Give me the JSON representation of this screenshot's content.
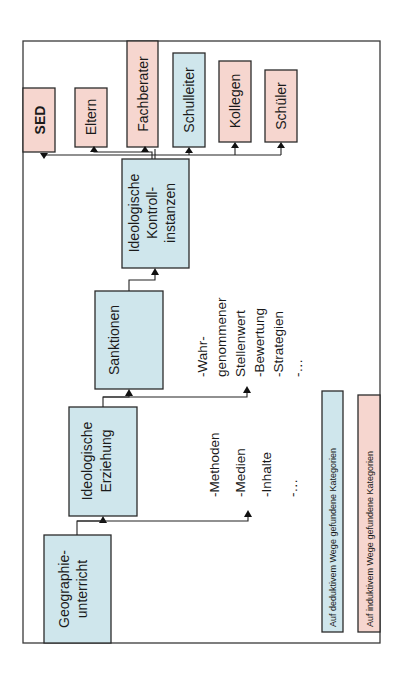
{
  "diagram": {
    "orientation": "rotated-90-ccw",
    "colors": {
      "deductive": "#cfe6ec",
      "inductive": "#f6d6cf",
      "border": "#2b2b2b"
    },
    "flow": [
      {
        "id": "geographie",
        "lines": [
          "Geographie-",
          "unterricht"
        ],
        "category": "deductive"
      },
      {
        "id": "erziehung",
        "lines": [
          "Ideologische",
          "Erziehung"
        ],
        "category": "deductive"
      },
      {
        "id": "sanktionen",
        "lines": [
          "Sanktionen"
        ],
        "category": "deductive"
      },
      {
        "id": "kontroll",
        "lines": [
          "Ideologische",
          "Kontroll-",
          "instanzen"
        ],
        "category": "deductive"
      }
    ],
    "instances": [
      {
        "id": "sed",
        "label": "SED",
        "category": "inductive"
      },
      {
        "id": "eltern",
        "label": "Eltern",
        "category": "inductive"
      },
      {
        "id": "fachberater",
        "label": "Fachberater",
        "category": "inductive"
      },
      {
        "id": "schulleiter",
        "label": "Schulleiter",
        "category": "deductive"
      },
      {
        "id": "kollegen",
        "label": "Kollegen",
        "category": "inductive"
      },
      {
        "id": "schueler",
        "label": "Schüler",
        "category": "inductive"
      }
    ],
    "erziehung_list": [
      "-Methoden",
      "-Medien",
      "-Inhalte",
      "-…"
    ],
    "sanktionen_list": [
      "-Wahr-",
      "genommener",
      "Stellenwert",
      "-Bewertung",
      "-Strategien",
      "-…"
    ],
    "legend": [
      {
        "label": "Auf deduktivem Wege gefundene Kategorien",
        "category": "deductive"
      },
      {
        "label": "Auf induktivem Wege gefundene Kategorien",
        "category": "inductive"
      }
    ]
  }
}
